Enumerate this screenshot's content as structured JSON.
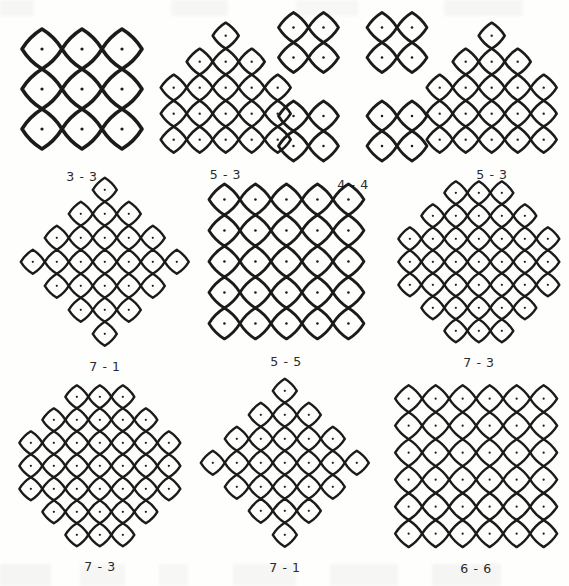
{
  "page": {
    "kind": "kolam-pattern-plate",
    "background_color": "#fefefd",
    "ink_color": "#1b1b1b",
    "columns": 3,
    "rows": 3
  },
  "chart_data": {
    "type": "table",
    "title": "",
    "xlabel": "",
    "ylabel": "",
    "categories": [
      "3 - 3",
      "5 - 3",
      "4 - 4",
      "5 - 3",
      "7 - 1",
      "5 - 5",
      "7 - 3",
      "7 - 3",
      "7 - 1",
      "6 - 6"
    ],
    "values": [
      33,
      53,
      44,
      53,
      71,
      55,
      73,
      73,
      71,
      66
    ]
  },
  "figures": [
    {
      "id": "kolam-3-3",
      "caption": "3 - 3",
      "start": 3,
      "end": 3,
      "shape": "square",
      "row_counts": [
        3,
        3,
        3
      ],
      "stroke": 3.6,
      "spacing": 40,
      "x": 8,
      "y": 14,
      "w": 148,
      "h": 150,
      "style": "bold"
    },
    {
      "id": "kolam-5-3-a",
      "caption": "5 - 3",
      "start": 5,
      "end": 3,
      "shape": "pyramid-flat",
      "row_counts": [
        1,
        3,
        5,
        5,
        5
      ],
      "stroke": 2.6,
      "spacing": 26,
      "x": 163,
      "y": 24,
      "w": 125,
      "h": 128,
      "style": "normal"
    },
    {
      "id": "kolam-4-4",
      "caption": "4 - 4",
      "start": 4,
      "end": 4,
      "shape": "quad-blocks",
      "row_counts": [
        2,
        2,
        2,
        2
      ],
      "stroke": 2.8,
      "spacing": 30,
      "x": 290,
      "y": 24,
      "w": 126,
      "h": 126,
      "style": "normal"
    },
    {
      "id": "kolam-5-3-b",
      "caption": "5 - 3",
      "start": 5,
      "end": 3,
      "shape": "pyramid-flat",
      "row_counts": [
        1,
        3,
        5,
        5,
        5
      ],
      "stroke": 2.6,
      "spacing": 26,
      "x": 428,
      "y": 24,
      "w": 128,
      "h": 128,
      "style": "normal"
    },
    {
      "id": "kolam-7-1",
      "caption": "7 - 1",
      "start": 7,
      "end": 1,
      "shape": "diamond",
      "row_counts": [
        1,
        3,
        5,
        7,
        5,
        3,
        1
      ],
      "stroke": 2.4,
      "spacing": 24,
      "x": 22,
      "y": 180,
      "w": 166,
      "h": 164,
      "style": "normal"
    },
    {
      "id": "kolam-5-5",
      "caption": "5 - 5",
      "start": 5,
      "end": 5,
      "shape": "square-ring",
      "row_counts": [
        5,
        5,
        5,
        5,
        5
      ],
      "stroke": 2.8,
      "spacing": 31,
      "x": 207,
      "y": 182,
      "w": 158,
      "h": 158,
      "style": "normal"
    },
    {
      "id": "kolam-7-3-a",
      "caption": "7 - 3",
      "start": 7,
      "end": 3,
      "shape": "octagon",
      "row_counts": [
        3,
        5,
        7,
        7,
        7,
        5,
        3
      ],
      "stroke": 2.4,
      "spacing": 23,
      "x": 398,
      "y": 180,
      "w": 162,
      "h": 164,
      "style": "normal"
    },
    {
      "id": "kolam-7-3-b",
      "caption": "7 - 3",
      "start": 7,
      "end": 3,
      "shape": "octagon",
      "row_counts": [
        3,
        5,
        7,
        7,
        7,
        5,
        3
      ],
      "stroke": 2.4,
      "spacing": 23,
      "x": 16,
      "y": 382,
      "w": 168,
      "h": 168,
      "style": "normal"
    },
    {
      "id": "kolam-7-1-b",
      "caption": "7 - 1",
      "start": 7,
      "end": 1,
      "shape": "pyramid-diamond",
      "row_counts": [
        1,
        3,
        5,
        7,
        5,
        3,
        1
      ],
      "stroke": 2.4,
      "spacing": 24,
      "x": 205,
      "y": 382,
      "w": 160,
      "h": 162,
      "style": "normal"
    },
    {
      "id": "kolam-6-6",
      "caption": "6 - 6",
      "start": 6,
      "end": 6,
      "shape": "square-split",
      "row_counts": [
        6,
        6,
        6,
        6,
        6,
        6
      ],
      "stroke": 2.4,
      "spacing": 27,
      "x": 392,
      "y": 382,
      "w": 168,
      "h": 168,
      "style": "normal"
    }
  ]
}
